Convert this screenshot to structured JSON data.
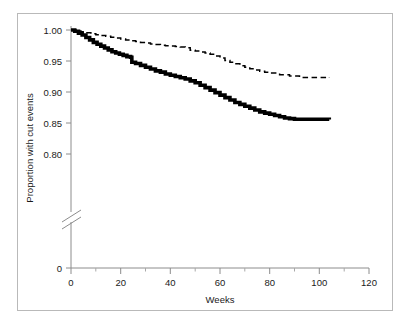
{
  "figure": {
    "border_color": "#b9b9b9",
    "background": "#ffffff"
  },
  "chart_data": {
    "type": "line",
    "title": "",
    "subtitle": "",
    "xlabel": "Weeks",
    "ylabel": "Proportion with cut events",
    "xlim": [
      0,
      120
    ],
    "ylim": [
      0.78,
      1.005
    ],
    "grid": false,
    "legend": null,
    "axis_break": {
      "axis": "y",
      "present": true,
      "style": "double-slash",
      "between": [
        0.0,
        0.78
      ]
    },
    "xticks": [
      0,
      20,
      40,
      60,
      80,
      100,
      120
    ],
    "xtick_labels": [
      "0",
      "20",
      "40",
      "60",
      "80",
      "100",
      "120"
    ],
    "xminor_ticks": [
      10,
      30,
      50,
      70,
      90,
      110
    ],
    "yticks": [
      1.0,
      0.95,
      0.9,
      0.85,
      0.8,
      0.0
    ],
    "ytick_labels": [
      "1.00",
      "0.95",
      "0.90",
      "0.85",
      "0.80",
      "0"
    ],
    "series": [
      {
        "name": "solid-curve",
        "style": "solid",
        "color": "#000000",
        "line_width": 3.6,
        "drawstyle": "steps-post",
        "x": [
          0,
          1.5,
          3,
          4.5,
          6,
          7.5,
          9,
          10.5,
          12,
          13.5,
          15,
          16.5,
          18,
          19.5,
          21,
          22.5,
          24,
          24.5,
          26,
          28,
          30,
          32,
          34,
          36,
          38,
          40,
          42,
          44,
          46,
          48,
          50,
          52,
          54,
          56,
          58,
          60,
          62,
          64,
          66,
          68,
          70,
          72,
          74,
          76,
          78,
          80,
          82,
          84,
          86,
          88,
          90,
          104
        ],
        "y": [
          1.0,
          0.998,
          0.995,
          0.992,
          0.988,
          0.984,
          0.98,
          0.977,
          0.974,
          0.971,
          0.968,
          0.965,
          0.963,
          0.961,
          0.959,
          0.957,
          0.956,
          0.948,
          0.946,
          0.943,
          0.94,
          0.937,
          0.934,
          0.932,
          0.929,
          0.927,
          0.925,
          0.923,
          0.921,
          0.918,
          0.915,
          0.911,
          0.907,
          0.903,
          0.899,
          0.895,
          0.891,
          0.887,
          0.883,
          0.88,
          0.877,
          0.874,
          0.871,
          0.868,
          0.866,
          0.864,
          0.862,
          0.86,
          0.858,
          0.857,
          0.856,
          0.8555
        ]
      },
      {
        "name": "dashed-curve",
        "style": "dashed",
        "color": "#000000",
        "line_width": 1.5,
        "drawstyle": "steps-post",
        "x": [
          0,
          2,
          4,
          6,
          8,
          10,
          12,
          14,
          16,
          18,
          20,
          22,
          24,
          26,
          28,
          30,
          32,
          34,
          36,
          38,
          40,
          42,
          44,
          46,
          48,
          50,
          52,
          54,
          56,
          58,
          60,
          62,
          64,
          66,
          68,
          70,
          72,
          74,
          76,
          78,
          80,
          84,
          88,
          92,
          104
        ],
        "y": [
          1.0,
          0.9985,
          0.997,
          0.9955,
          0.994,
          0.9925,
          0.991,
          0.99,
          0.9885,
          0.987,
          0.9855,
          0.984,
          0.9825,
          0.9815,
          0.98,
          0.979,
          0.9775,
          0.9765,
          0.9755,
          0.9745,
          0.974,
          0.9735,
          0.9725,
          0.9715,
          0.9675,
          0.966,
          0.9645,
          0.963,
          0.961,
          0.958,
          0.955,
          0.951,
          0.948,
          0.9455,
          0.9425,
          0.94,
          0.9375,
          0.9355,
          0.9335,
          0.932,
          0.9305,
          0.928,
          0.926,
          0.9235,
          0.9225
        ]
      }
    ]
  },
  "axes": {
    "y_axis_title": "Proportion with cut events",
    "x_axis_title": "Weeks"
  }
}
